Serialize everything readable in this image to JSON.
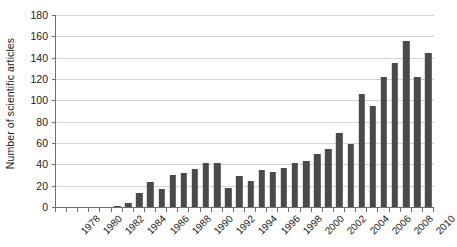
{
  "chart_data": {
    "type": "bar",
    "title": "",
    "subtitle": "",
    "xlabel": "",
    "ylabel": "Number of scientific articles",
    "ylim": [
      0,
      180
    ],
    "y_ticks": [
      0,
      20,
      40,
      60,
      80,
      100,
      120,
      140,
      160,
      180
    ],
    "grid": true,
    "legend": false,
    "legend_position": "none",
    "bar_color": "#4a4a4a",
    "axis_color": "#6e6e6e",
    "gridline_color": "#d4d4d4",
    "background_color": "#ffffff",
    "x_tick_label_rotation": -45,
    "categories": [
      "1978",
      "1979",
      "1980",
      "1981",
      "1982",
      "1983",
      "1984",
      "1985",
      "1986",
      "1987",
      "1988",
      "1989",
      "1990",
      "1991",
      "1992",
      "1993",
      "1994",
      "1995",
      "1996",
      "1997",
      "1998",
      "1999",
      "2000",
      "2001",
      "2002",
      "2003",
      "2004",
      "2005",
      "2006",
      "2007",
      "2008",
      "2009",
      "2010",
      "2011"
    ],
    "visible_x_tick_labels": [
      "1978",
      "1980",
      "1982",
      "1984",
      "1986",
      "1988",
      "1990",
      "1992",
      "1994",
      "1996",
      "1998",
      "2000",
      "2002",
      "2004",
      "2006",
      "2008",
      "2010"
    ],
    "values": [
      0,
      0,
      0,
      0,
      0,
      1,
      4,
      13,
      23,
      17,
      30,
      32,
      36,
      41,
      41,
      18,
      29,
      24,
      35,
      33,
      37,
      41,
      43,
      50,
      54,
      69,
      59,
      106,
      95,
      122,
      135,
      156,
      122,
      144
    ]
  }
}
